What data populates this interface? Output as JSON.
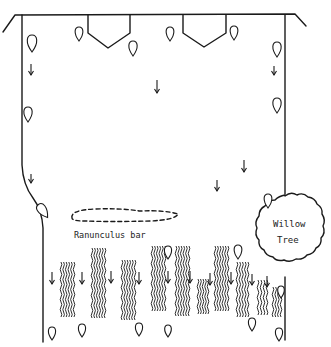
{
  "diagram": {
    "title": "",
    "labels": {
      "ranunculus": "Ranunculus bar",
      "willow_line1": "Willow",
      "willow_line2": "Tree"
    },
    "colors": {
      "ink": "#1a1a1a",
      "background": "#ffffff"
    },
    "elements": {
      "channel_banks": [
        "left-bank",
        "right-bank",
        "top-bank"
      ],
      "groynes": [
        {
          "id": "groyne-1",
          "points": "88,15 88,33 108,48 130,33 130,15"
        },
        {
          "id": "groyne-2",
          "points": "183,15 183,33 204,47 226,33 226,15"
        }
      ],
      "leaves": [
        {
          "x": 32,
          "y": 35,
          "h": 17,
          "rot": 0
        },
        {
          "x": 79,
          "y": 27,
          "h": 14,
          "rot": 0
        },
        {
          "x": 133,
          "y": 41,
          "h": 15,
          "rot": 0
        },
        {
          "x": 170,
          "y": 27,
          "h": 14,
          "rot": 0
        },
        {
          "x": 234,
          "y": 26,
          "h": 14,
          "rot": 0
        },
        {
          "x": 277,
          "y": 42,
          "h": 15,
          "rot": 0
        },
        {
          "x": 277,
          "y": 98,
          "h": 15,
          "rot": 0
        },
        {
          "x": 28,
          "y": 107,
          "h": 15,
          "rot": 0
        },
        {
          "x": 43,
          "y": 203,
          "h": 16,
          "rot": -35
        },
        {
          "x": 268,
          "y": 194,
          "h": 14,
          "rot": 0
        },
        {
          "x": 52,
          "y": 327,
          "h": 13,
          "rot": 0
        },
        {
          "x": 82,
          "y": 324,
          "h": 13,
          "rot": 0
        },
        {
          "x": 139,
          "y": 323,
          "h": 13,
          "rot": 0
        },
        {
          "x": 168,
          "y": 246,
          "h": 13,
          "rot": 0
        },
        {
          "x": 238,
          "y": 245,
          "h": 14,
          "rot": 0
        },
        {
          "x": 168,
          "y": 325,
          "h": 12,
          "rot": 0
        },
        {
          "x": 252,
          "y": 318,
          "h": 13,
          "rot": 0
        },
        {
          "x": 279,
          "y": 328,
          "h": 13,
          "rot": 0
        },
        {
          "x": 281,
          "y": 286,
          "h": 12,
          "rot": 0
        }
      ],
      "flow_arrows": [
        {
          "x": 31,
          "y": 64,
          "len": 11
        },
        {
          "x": 157,
          "y": 80,
          "len": 13
        },
        {
          "x": 274,
          "y": 66,
          "len": 9
        },
        {
          "x": 244,
          "y": 160,
          "len": 12
        },
        {
          "x": 217,
          "y": 180,
          "len": 11
        },
        {
          "x": 31,
          "y": 174,
          "len": 9
        },
        {
          "x": 52,
          "y": 272,
          "len": 12
        },
        {
          "x": 82,
          "y": 272,
          "len": 12
        },
        {
          "x": 111,
          "y": 271,
          "len": 12
        },
        {
          "x": 139,
          "y": 272,
          "len": 12
        },
        {
          "x": 168,
          "y": 271,
          "len": 12
        },
        {
          "x": 190,
          "y": 271,
          "len": 12
        },
        {
          "x": 210,
          "y": 273,
          "len": 12
        },
        {
          "x": 231,
          "y": 272,
          "len": 12
        },
        {
          "x": 252,
          "y": 274,
          "len": 11
        },
        {
          "x": 267,
          "y": 276,
          "len": 11
        }
      ],
      "weed_beds": [
        {
          "x": 61,
          "y": 262,
          "w": 13,
          "h": 55
        },
        {
          "x": 92,
          "y": 248,
          "w": 13,
          "h": 67
        },
        {
          "x": 122,
          "y": 260,
          "w": 13,
          "h": 56
        },
        {
          "x": 152,
          "y": 246,
          "w": 13,
          "h": 64
        },
        {
          "x": 176,
          "y": 246,
          "w": 13,
          "h": 66
        },
        {
          "x": 198,
          "y": 279,
          "w": 10,
          "h": 35
        },
        {
          "x": 215,
          "y": 246,
          "w": 13,
          "h": 64
        },
        {
          "x": 237,
          "y": 262,
          "w": 11,
          "h": 55
        },
        {
          "x": 258,
          "y": 280,
          "w": 9,
          "h": 35
        },
        {
          "x": 273,
          "y": 287,
          "w": 8,
          "h": 26
        }
      ]
    }
  }
}
